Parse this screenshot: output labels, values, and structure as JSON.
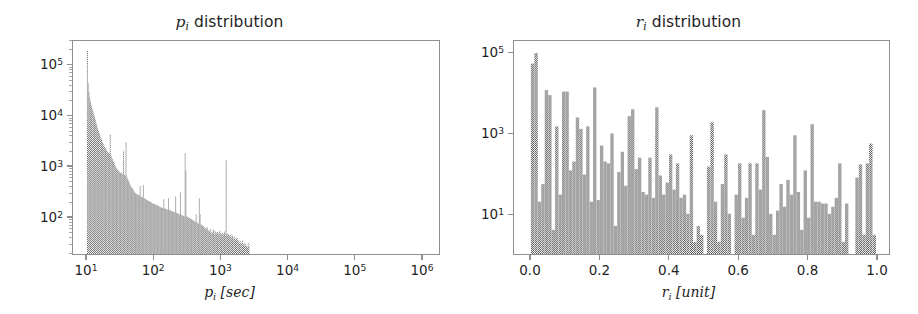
{
  "figure": {
    "width": 918,
    "height": 314,
    "background": "#ffffff",
    "bar_color": "#4a4a4a",
    "bar_mean_color": "#8a8a8a",
    "frame_color": "#8e8e8e",
    "text_color": "#1f1f1f"
  },
  "panels": [
    {
      "id": "p-distribution",
      "title_var": "p",
      "title_sub": "i",
      "title_text": " distribution",
      "xlabel_var": "p",
      "xlabel_sub": "i",
      "xlabel_unit": " [sec]",
      "yticks": [
        "10",
        "10",
        "10",
        "10"
      ],
      "ytick_exps": [
        "2",
        "3",
        "4",
        "5"
      ],
      "xticks": [
        "10",
        "10",
        "10",
        "10",
        "10",
        "10"
      ],
      "xtick_exps": [
        "1",
        "2",
        "3",
        "4",
        "5",
        "6"
      ],
      "minor_ticks": true
    },
    {
      "id": "r-distribution",
      "title_var": "r",
      "title_sub": "i",
      "title_text": " distribution",
      "xlabel_var": "r",
      "xlabel_sub": "i",
      "xlabel_unit": " [unit]",
      "yticks": [
        "10",
        "10",
        "10"
      ],
      "ytick_exps": [
        "1",
        "3",
        "5"
      ],
      "xticks": [
        "0.0",
        "0.2",
        "0.4",
        "0.6",
        "0.8",
        "1.0"
      ],
      "xtick_exps": [
        "",
        "",
        "",
        "",
        "",
        ""
      ],
      "minor_ticks": false
    }
  ],
  "chart_data": [
    {
      "type": "bar",
      "id": "p-distribution",
      "title": "p_i distribution",
      "xlabel": "p_i [sec]",
      "ylabel": "",
      "xscale": "log",
      "yscale": "log",
      "xlim": [
        6.0,
        3000000.0
      ],
      "ylim": [
        18,
        300000
      ],
      "xtick_values": [
        10,
        100,
        1000,
        10000,
        100000,
        1000000
      ],
      "xtick_labels": [
        "10^1",
        "10^2",
        "10^3",
        "10^4",
        "10^5",
        "10^6"
      ],
      "ytick_values": [
        100,
        1000,
        10000,
        100000
      ],
      "ytick_labels": [
        "10^2",
        "10^3",
        "10^4",
        "10^5"
      ],
      "grid": false,
      "legend": "none",
      "note": "Log-binned histogram of p_i. Sharp peak at p_i=10 reaching ~2e5, power-law decay, with spikes at ~60, ~300, ~500, ~2.5e4, ~8e4 and ~1e6.",
      "bin_edges_log10": [
        1.0,
        3.43
      ],
      "values": [
        190000,
        44000,
        30000,
        23000,
        19000,
        16000,
        14000,
        12500,
        11000,
        9600,
        8400,
        7200,
        6400,
        5600,
        5000,
        4500,
        4000,
        3600,
        3300,
        3000,
        2800,
        2550,
        2400,
        2250,
        2100,
        2000,
        1900,
        1800,
        1750,
        4200,
        1600,
        1450,
        1350,
        1250,
        1150,
        1050,
        980,
        900,
        860,
        820,
        790,
        760,
        740,
        720,
        700,
        690,
        2000,
        660,
        640,
        3000,
        620,
        560,
        520,
        470,
        430,
        400,
        380,
        360,
        340,
        320,
        300,
        290,
        280,
        275,
        270,
        265,
        260,
        400,
        250,
        240,
        235,
        420,
        230,
        225,
        220,
        215,
        210,
        205,
        200,
        198,
        195,
        190,
        185,
        180,
        178,
        175,
        172,
        170,
        168,
        165,
        160,
        158,
        155,
        152,
        150,
        148,
        146,
        220,
        144,
        142,
        140,
        138,
        136,
        230,
        134,
        132,
        130,
        128,
        126,
        124,
        122,
        120,
        250,
        118,
        116,
        114,
        112,
        110,
        300,
        108,
        106,
        104,
        102,
        100,
        1800,
        800,
        99,
        98,
        96,
        94,
        92,
        90,
        88,
        86,
        84,
        82,
        80,
        78,
        110,
        76,
        74,
        72,
        230,
        110,
        70,
        68,
        66,
        64,
        62,
        60,
        58,
        56,
        62,
        54,
        52,
        50,
        56,
        48,
        46,
        50,
        55,
        44,
        52,
        48,
        46,
        50,
        44,
        48,
        52,
        46,
        44,
        48,
        42,
        46,
        50,
        44,
        1300,
        42,
        46,
        44,
        42,
        40,
        44,
        38,
        42,
        36,
        40,
        38,
        34,
        36,
        38,
        32,
        34,
        30,
        32,
        28,
        30,
        34,
        28,
        26,
        30,
        28,
        26,
        24,
        26,
        30
      ]
    },
    {
      "type": "bar",
      "id": "r-distribution",
      "title": "r_i distribution",
      "xlabel": "r_i [unit]",
      "ylabel": "",
      "xscale": "linear",
      "yscale": "log",
      "xlim": [
        -0.035,
        1.045
      ],
      "ylim": [
        1,
        200000
      ],
      "xtick_values": [
        0.0,
        0.2,
        0.4,
        0.6,
        0.8,
        1.0
      ],
      "xtick_labels": [
        "0.0",
        "0.2",
        "0.4",
        "0.6",
        "0.8",
        "1.0"
      ],
      "ytick_values": [
        10,
        1000,
        100000
      ],
      "ytick_labels": [
        "10^1",
        "10^3",
        "10^5"
      ],
      "grid": false,
      "legend": "none",
      "note": "Histogram of r_i over [0,1] with ~100 bins; very spiky, dense near 0 (up to ~1e5) and sparse toward 1.",
      "bin_count": 100,
      "values": [
        55000,
        100000,
        20,
        55,
        12000,
        9000,
        4,
        1500,
        30,
        11000,
        11000,
        120,
        200,
        2500,
        1300,
        95,
        1500,
        20,
        14000,
        22,
        500,
        200,
        180,
        1000,
        5,
        110,
        350,
        50,
        2700,
        4000,
        130,
        250,
        35,
        30,
        250,
        25,
        4500,
        90,
        30,
        60,
        300,
        40,
        180,
        25,
        30,
        10,
        900,
        2,
        5,
        3,
        1,
        150,
        1900,
        20,
        2,
        55,
        300,
        10,
        1,
        30,
        180,
        8,
        25,
        180,
        3,
        180,
        40,
        3800,
        260,
        10,
        3,
        12,
        55,
        15,
        70,
        30,
        900,
        35,
        4,
        120,
        8,
        1700,
        20,
        20,
        18,
        18,
        10,
        15,
        25,
        180,
        2,
        18,
        1,
        1,
        80,
        170,
        3,
        180,
        560,
        3
      ]
    }
  ]
}
